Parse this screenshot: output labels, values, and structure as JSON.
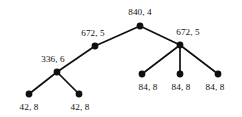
{
  "diagram": {
    "type": "tree",
    "title": "",
    "background_color": "#ffffff",
    "node_color": "#101010",
    "edge_color": "#0f0f0f",
    "label_color": "#111111",
    "nodes": [
      {
        "id": "root",
        "label": "840, 4",
        "x": 140,
        "y": 26,
        "label_x": 140,
        "label_y": 15,
        "label_anchor": "middle",
        "depth": 0
      },
      {
        "id": "l1",
        "label": "672, 5",
        "x": 95,
        "y": 46,
        "label_x": 93,
        "label_y": 36,
        "label_anchor": "middle",
        "depth": 1
      },
      {
        "id": "r1",
        "label": "672, 5",
        "x": 180,
        "y": 45,
        "label_x": 188,
        "label_y": 35,
        "label_anchor": "middle",
        "depth": 1
      },
      {
        "id": "l2",
        "label": "336, 6",
        "x": 57,
        "y": 72,
        "label_x": 53,
        "label_y": 62,
        "label_anchor": "middle",
        "depth": 2
      },
      {
        "id": "l3a",
        "label": "42, 8",
        "x": 29,
        "y": 94,
        "label_x": 29,
        "label_y": 110,
        "label_anchor": "middle",
        "depth": 3
      },
      {
        "id": "l3b",
        "label": "42, 8",
        "x": 79,
        "y": 94,
        "label_x": 80,
        "label_y": 110,
        "label_anchor": "middle",
        "depth": 3
      },
      {
        "id": "r2a",
        "label": "84, 8",
        "x": 142,
        "y": 74,
        "label_x": 148,
        "label_y": 90,
        "label_anchor": "middle",
        "depth": 2
      },
      {
        "id": "r2b",
        "label": "84, 8",
        "x": 180,
        "y": 74,
        "label_x": 181,
        "label_y": 90,
        "label_anchor": "middle",
        "depth": 2
      },
      {
        "id": "r2c",
        "label": "84, 8",
        "x": 218,
        "y": 74,
        "label_x": 215,
        "label_y": 90,
        "label_anchor": "middle",
        "depth": 2
      }
    ],
    "edges": [
      {
        "from": "root",
        "to": "l1"
      },
      {
        "from": "root",
        "to": "r1"
      },
      {
        "from": "l1",
        "to": "l2"
      },
      {
        "from": "l2",
        "to": "l3a"
      },
      {
        "from": "l2",
        "to": "l3b"
      },
      {
        "from": "r1",
        "to": "r2a"
      },
      {
        "from": "r1",
        "to": "r2b"
      },
      {
        "from": "r1",
        "to": "r2c"
      }
    ],
    "node_radius": 3.4
  }
}
